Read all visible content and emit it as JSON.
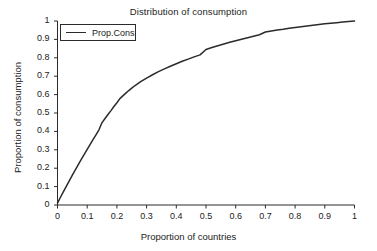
{
  "chart_data": {
    "type": "line",
    "title": "Distribution of consumption",
    "xlabel": "Proportion of countries",
    "ylabel": "Proportion of consumption",
    "xlim": [
      0,
      1
    ],
    "ylim": [
      0,
      1
    ],
    "grid": false,
    "legend_position": "top-left",
    "legend": [
      "Prop.Cons"
    ],
    "xticks": [
      "0",
      "0.1",
      "0.2",
      "0.3",
      "0.4",
      "0.5",
      "0.6",
      "0.7",
      "0.8",
      "0.9",
      "1"
    ],
    "xtick_values": [
      0,
      0.1,
      0.2,
      0.3,
      0.4,
      0.5,
      0.6,
      0.7,
      0.8,
      0.9,
      1
    ],
    "yticks": [
      "0",
      "0.1",
      "0.2",
      "0.3",
      "0.4",
      "0.5",
      "0.6",
      "0.7",
      "0.8",
      "0.9",
      "1"
    ],
    "ytick_values": [
      0,
      0.1,
      0.2,
      0.3,
      0.4,
      0.5,
      0.6,
      0.7,
      0.8,
      0.9,
      1
    ],
    "line_color": "#2b2b2b",
    "series": [
      {
        "name": "Prop.Cons",
        "x": [
          0.0,
          0.01,
          0.02,
          0.03,
          0.04,
          0.05,
          0.06,
          0.07,
          0.08,
          0.09,
          0.1,
          0.11,
          0.12,
          0.13,
          0.14,
          0.15,
          0.16,
          0.17,
          0.18,
          0.19,
          0.2,
          0.21,
          0.22,
          0.23,
          0.24,
          0.25,
          0.26,
          0.28,
          0.3,
          0.32,
          0.34,
          0.36,
          0.38,
          0.4,
          0.42,
          0.44,
          0.46,
          0.48,
          0.5,
          0.52,
          0.54,
          0.56,
          0.58,
          0.6,
          0.62,
          0.64,
          0.66,
          0.68,
          0.7,
          0.72,
          0.74,
          0.76,
          0.78,
          0.8,
          0.82,
          0.84,
          0.86,
          0.88,
          0.9,
          0.92,
          0.94,
          0.96,
          0.98,
          1.0
        ],
        "y": [
          0.01,
          0.042,
          0.073,
          0.103,
          0.133,
          0.162,
          0.191,
          0.22,
          0.248,
          0.275,
          0.302,
          0.33,
          0.357,
          0.383,
          0.41,
          0.448,
          0.47,
          0.492,
          0.513,
          0.535,
          0.556,
          0.578,
          0.593,
          0.608,
          0.622,
          0.635,
          0.648,
          0.67,
          0.69,
          0.708,
          0.725,
          0.74,
          0.754,
          0.768,
          0.781,
          0.793,
          0.805,
          0.816,
          0.845,
          0.856,
          0.866,
          0.875,
          0.884,
          0.893,
          0.901,
          0.909,
          0.917,
          0.925,
          0.94,
          0.946,
          0.951,
          0.955,
          0.96,
          0.965,
          0.969,
          0.973,
          0.977,
          0.981,
          0.985,
          0.988,
          0.991,
          0.994,
          0.997,
          1.0
        ]
      }
    ]
  }
}
